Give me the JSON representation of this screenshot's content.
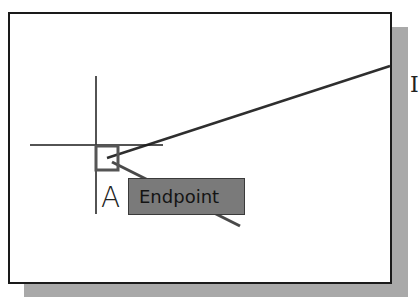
{
  "viewport": {
    "background": "#ffffff",
    "frame_border": "#1a1a1a",
    "shadow_color": "#a9a9a9"
  },
  "osnap_tooltip": {
    "label": "Endpoint",
    "background": "#7a7a7a"
  },
  "point_label": "A",
  "edge_text": "I",
  "geometry": {
    "line_start": [
      107,
      158
    ],
    "line_end": [
      390,
      67
    ],
    "crosshair_center": [
      96,
      145
    ],
    "pickbox": [
      95,
      145,
      22,
      24
    ]
  }
}
